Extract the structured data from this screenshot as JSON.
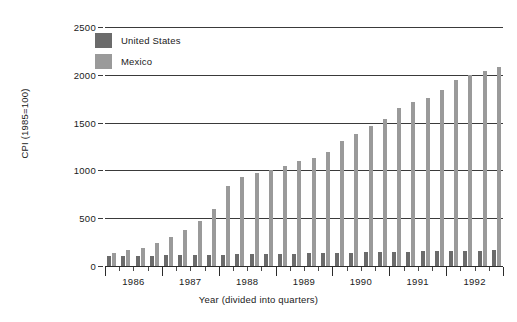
{
  "chart_data": {
    "type": "bar",
    "title": "",
    "xlabel": "Year (divided into quarters)",
    "ylabel": "CPI (1985=100)",
    "ylim": [
      0,
      2500
    ],
    "yticks": [
      0,
      500,
      1000,
      1500,
      2000,
      2500
    ],
    "grid": true,
    "legend_position": "top-left",
    "categories": [
      "1986 Q1",
      "1986 Q2",
      "1986 Q3",
      "1986 Q4",
      "1987 Q1",
      "1987 Q2",
      "1987 Q3",
      "1987 Q4",
      "1988 Q1",
      "1988 Q2",
      "1988 Q3",
      "1988 Q4",
      "1989 Q1",
      "1989 Q2",
      "1989 Q3",
      "1989 Q4",
      "1990 Q1",
      "1990 Q2",
      "1990 Q3",
      "1990 Q4",
      "1991 Q1",
      "1991 Q2",
      "1991 Q3",
      "1991 Q4",
      "1992 Q1",
      "1992 Q2",
      "1992 Q3",
      "1992 Q4"
    ],
    "x_tick_labels": [
      "1986",
      "1987",
      "1988",
      "1989",
      "1990",
      "1991",
      "1992"
    ],
    "series": [
      {
        "name": "United States",
        "color": "#6b6b6b",
        "values": [
          105,
          107,
          108,
          109,
          111,
          113,
          115,
          117,
          119,
          121,
          123,
          125,
          128,
          130,
          132,
          134,
          137,
          140,
          143,
          146,
          149,
          151,
          153,
          155,
          157,
          159,
          162,
          165
        ]
      },
      {
        "name": "Mexico",
        "color": "#9a9a9a",
        "values": [
          140,
          165,
          190,
          245,
          305,
          380,
          475,
          600,
          840,
          935,
          975,
          1005,
          1050,
          1095,
          1130,
          1190,
          1305,
          1385,
          1460,
          1535,
          1650,
          1715,
          1760,
          1840,
          1945,
          1995,
          2035,
          2080
        ]
      }
    ]
  },
  "legend": {
    "items": [
      {
        "label": "United States"
      },
      {
        "label": "Mexico"
      }
    ]
  }
}
